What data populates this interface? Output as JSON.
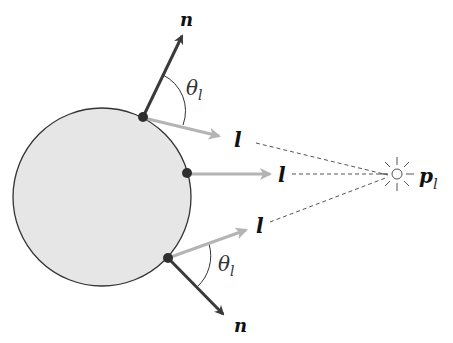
{
  "diagram": {
    "labels": {
      "normal_top": "n",
      "normal_bottom": "n",
      "light_top": "l",
      "light_middle": "l",
      "light_bottom": "l",
      "theta_top": "θ",
      "theta_top_sub": "l",
      "theta_bottom": "θ",
      "theta_bottom_sub": "l",
      "light_pos": "p",
      "light_pos_sub": "l"
    },
    "colors": {
      "sphere_fill": "#e6e6e6",
      "sphere_stroke": "#333333",
      "normal_arrow": "#3a3a3a",
      "light_arrow": "#b4b4b4",
      "point": "#2f2f2f",
      "dashed": "#555555"
    }
  }
}
